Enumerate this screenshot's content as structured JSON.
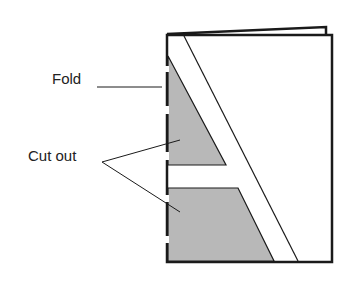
{
  "diagram": {
    "labels": {
      "fold": "Fold",
      "cut_out": "Cut out"
    },
    "colors": {
      "line": "#1a1a1a",
      "shade": "#b8b8b8",
      "paper": "#ffffff"
    }
  }
}
